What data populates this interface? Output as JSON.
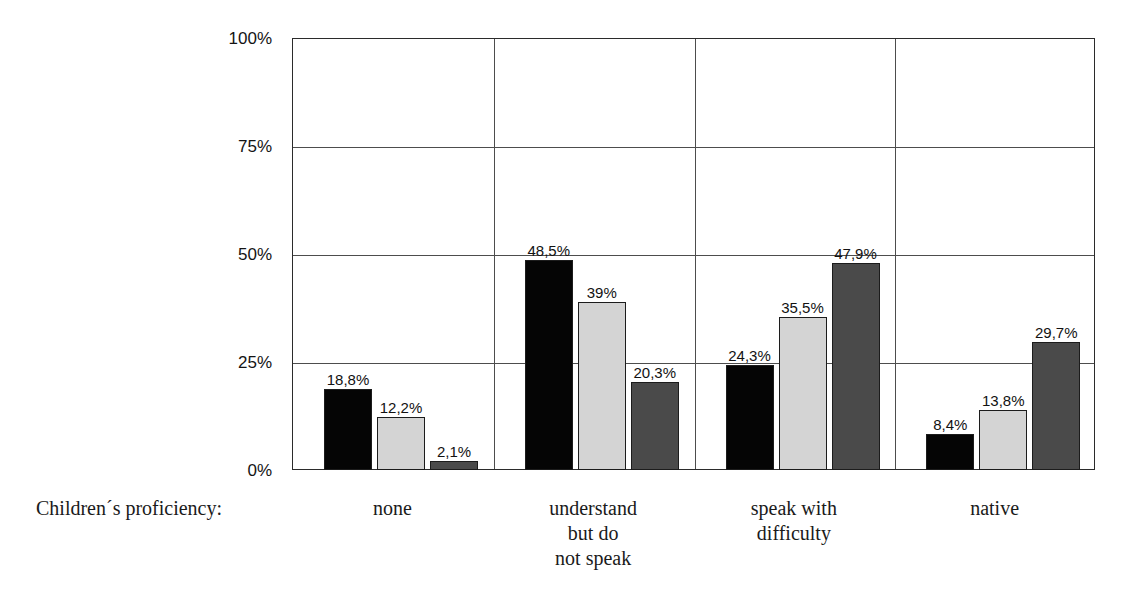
{
  "chart_data": {
    "type": "bar",
    "title": "",
    "xlabel": "Children´s proficiency:",
    "ylabel": "",
    "ylim": [
      0,
      100
    ],
    "grid": true,
    "legend": "none",
    "y_ticks": [
      "0%",
      "25%",
      "50%",
      "75%",
      "100%"
    ],
    "y_tick_values": [
      0,
      25,
      50,
      75,
      100
    ],
    "categories": [
      "none",
      "understand but do not speak",
      "speak with difficulty",
      "native"
    ],
    "category_lines": [
      [
        "none"
      ],
      [
        "understand",
        "but do",
        "not speak"
      ],
      [
        "speak with",
        "difficulty"
      ],
      [
        "native"
      ]
    ],
    "series": [
      {
        "name": "series-1",
        "color": "#050505",
        "values": [
          18.8,
          48.5,
          24.3,
          8.4
        ],
        "labels": [
          "18,8%",
          "48,5%",
          "24,3%",
          "8,4%"
        ]
      },
      {
        "name": "series-2",
        "color": "#d4d4d4",
        "values": [
          12.2,
          39.0,
          35.5,
          13.8
        ],
        "labels": [
          "12,2%",
          "39%",
          "35,5%",
          "13,8%"
        ]
      },
      {
        "name": "series-3",
        "color": "#4a4a4a",
        "values": [
          2.1,
          20.3,
          47.9,
          29.7
        ],
        "labels": [
          "2,1%",
          "20,3%",
          "47,9%",
          "29,7%"
        ]
      }
    ]
  },
  "axis_caption": "Children´s proficiency:"
}
